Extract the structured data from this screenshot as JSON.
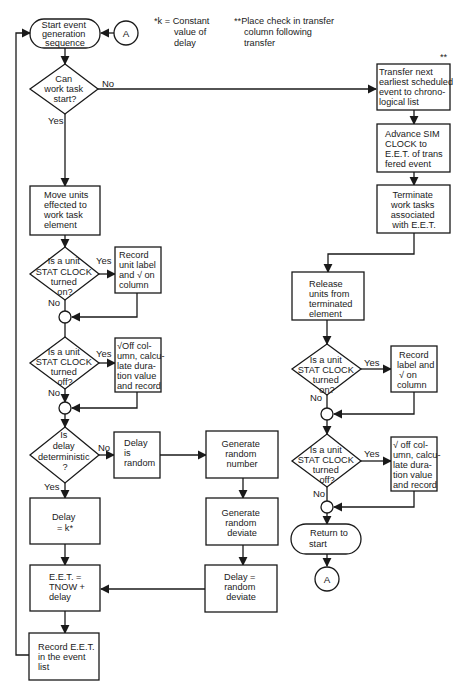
{
  "notes": {
    "k_note": [
      "*k = Constant",
      "value of",
      "delay"
    ],
    "transfer_note": [
      "**Place check in transfer",
      "column following",
      "transfer"
    ]
  },
  "connectors": {
    "top": "A",
    "bottom": "A"
  },
  "left": {
    "start": [
      "Start event",
      "generation",
      "sequence"
    ],
    "can_start": [
      "Can",
      "work task",
      "start?"
    ],
    "move_units": [
      "Move units",
      "effected to",
      "work task",
      "element"
    ],
    "stat_on": [
      "Is a unit",
      "STAT CLOCK",
      "turned",
      "on?"
    ],
    "record_on": [
      "Record",
      "unit label",
      "and √ on",
      "column"
    ],
    "stat_off": [
      "Is a unit",
      "STAT CLOCK",
      "turned",
      "off?"
    ],
    "off_calc": [
      "√Off col-",
      "umn, calcu-",
      "late dura-",
      "tion value",
      "and record"
    ],
    "deterministic": [
      "Is",
      "delay",
      "deterministic",
      "?"
    ],
    "delay_random": [
      "Delay",
      "is",
      "random"
    ],
    "delay_k": [
      "Delay",
      "= k*"
    ],
    "eet": [
      "E.E.T. =",
      "TNOW +",
      "delay"
    ],
    "record_eet": [
      "Record E.E.T.",
      "in the event",
      "list"
    ]
  },
  "middle": {
    "gen_number": [
      "Generate",
      "random",
      "number"
    ],
    "gen_deviate": [
      "Generate",
      "random",
      "deviate"
    ],
    "delay_deviate": [
      "Delay =",
      "random",
      "deviate"
    ]
  },
  "right": {
    "transfer_mark": "**",
    "transfer": [
      "Transfer next",
      "earliest scheduled",
      "event to chrono-",
      "logical list"
    ],
    "advance": [
      "Advance SIM",
      "CLOCK to",
      "E.E.T. of trans",
      "fered event"
    ],
    "terminate": [
      "Terminate",
      "work tasks",
      "associated",
      "with E.E.T."
    ],
    "release": [
      "Release",
      "units from",
      "terminated",
      "element"
    ],
    "stat_on": [
      "Is a unit",
      "STAT CLOCK",
      "turned",
      "on?"
    ],
    "record_on": [
      "Record",
      "label and",
      "√ on",
      "column"
    ],
    "stat_off": [
      "Is a unit",
      "STAT CLOCK",
      "turned",
      "off?"
    ],
    "off_calc": [
      "√ off col-",
      "umn, calcu-",
      "late dura-",
      "tion value",
      "and record"
    ],
    "return": [
      "Return to",
      "start"
    ]
  },
  "labels": {
    "yes": "Yes",
    "no": "No"
  }
}
